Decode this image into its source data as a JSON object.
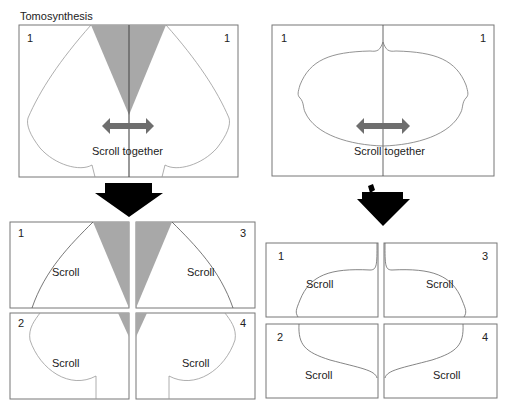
{
  "title": "Tomosynthesis",
  "left": {
    "top_panel": {
      "num_left": "1",
      "num_right": "1",
      "label": "Scroll together"
    },
    "quads": [
      {
        "num": "1",
        "label": "Scroll"
      },
      {
        "num": "3",
        "label": "Scroll"
      },
      {
        "num": "2",
        "label": "Scroll"
      },
      {
        "num": "4",
        "label": "Scroll"
      }
    ]
  },
  "right": {
    "top_panel": {
      "num_left": "1",
      "num_right": "1",
      "label": "Scroll together"
    },
    "quads": [
      {
        "num": "1",
        "label": "Scroll"
      },
      {
        "num": "3",
        "label": "Scroll"
      },
      {
        "num": "2",
        "label": "Scroll"
      },
      {
        "num": "4",
        "label": "Scroll"
      }
    ]
  },
  "colors": {
    "shade": "#a8a8a8",
    "arrow_gray": "#6e6e6e",
    "line": "#555555",
    "block_arrow": "#000000"
  }
}
